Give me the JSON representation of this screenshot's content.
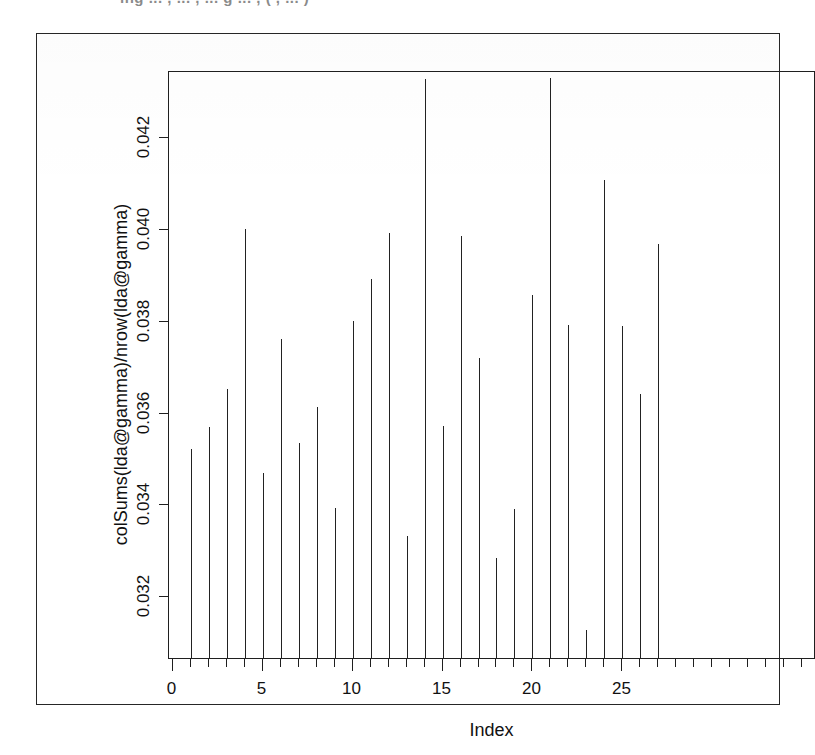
{
  "page": {
    "background": "#ffffff",
    "ink_color": "#222222",
    "top_bleed_text": "ing ... , ... , ... g ... , ( , ... )"
  },
  "axes": {
    "x_title": "Index",
    "y_title": "colSums(lda@gamma)/nrow(lda@gamma)",
    "x_ticks": [
      0,
      5,
      10,
      15,
      20,
      25
    ],
    "x_tick_labels": [
      "0",
      "5",
      "10",
      "15",
      "20",
      "25"
    ],
    "y_ticks": [
      0.032,
      0.034,
      0.036,
      0.038,
      0.04,
      0.042
    ],
    "y_tick_labels": [
      "0.032",
      "0.034",
      "0.036",
      "0.038",
      "0.040",
      "0.042"
    ],
    "x_min": -0.2,
    "x_max": 35.7,
    "y_min": 0.03065,
    "y_max": 0.04345
  },
  "chart_data": {
    "type": "bar",
    "title": "",
    "subtitle": "",
    "xlabel": "Index",
    "ylabel": "colSums(lda@gamma)/nrow(lda@gamma)",
    "xlim": [
      -0.2,
      35.7
    ],
    "ylim": [
      0.03065,
      0.04345
    ],
    "grid": false,
    "legend": null,
    "style": "spike/impulse plot (R type='h')",
    "x_tick_labels": [
      "0",
      "5",
      "10",
      "15",
      "20",
      "25"
    ],
    "y_tick_labels": [
      "0.032",
      "0.034",
      "0.036",
      "0.038",
      "0.040",
      "0.042"
    ],
    "categories": [
      1,
      2,
      3,
      4,
      5,
      6,
      7,
      8,
      9,
      10,
      11,
      12,
      13,
      14,
      15,
      16,
      17,
      18,
      19,
      20,
      21,
      22,
      23,
      24,
      25,
      26,
      27
    ],
    "x": [
      1,
      2,
      3,
      4,
      5,
      6,
      7,
      8,
      9,
      10,
      11,
      12,
      13,
      14,
      15,
      16,
      17,
      18,
      19,
      20,
      21,
      22,
      23,
      24,
      25,
      26,
      27
    ],
    "values": [
      0.03521,
      0.03569,
      0.03652,
      0.04001,
      0.03468,
      0.03761,
      0.03534,
      0.03613,
      0.03392,
      0.038,
      0.03891,
      0.03991,
      0.03332,
      0.04328,
      0.0357,
      0.03985,
      0.03719,
      0.03283,
      0.0339,
      0.03857,
      0.0433,
      0.03791,
      0.03126,
      0.04108,
      0.0379,
      0.0364,
      0.03968
    ],
    "series": [
      {
        "name": "colSums(lda@gamma)/nrow(lda@gamma)",
        "values": [
          0.03521,
          0.03569,
          0.03652,
          0.04001,
          0.03468,
          0.03761,
          0.03534,
          0.03613,
          0.03392,
          0.038,
          0.03891,
          0.03991,
          0.03332,
          0.04328,
          0.0357,
          0.03985,
          0.03719,
          0.03283,
          0.0339,
          0.03857,
          0.0433,
          0.03791,
          0.03126,
          0.04108,
          0.0379,
          0.0364,
          0.03968
        ]
      }
    ],
    "notes": [
      "Spikes 14 and 21 are clipped at the top of the plot region (tallest topics).",
      "Spike 23 is the shortest, barely rising above the x-axis."
    ]
  }
}
